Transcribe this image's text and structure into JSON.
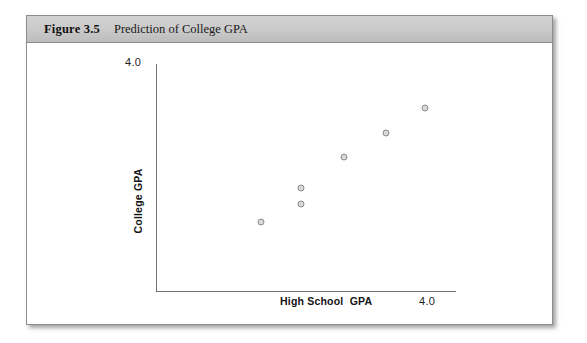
{
  "figure": {
    "caption_label": "Figure 3.5",
    "caption_text": "Prediction of College GPA"
  },
  "chart_data": {
    "type": "scatter",
    "title": "Prediction of College GPA",
    "xlabel": "High School  GPA",
    "ylabel": "College GPA",
    "xlim": [
      0,
      4.0
    ],
    "ylim": [
      0,
      4.0
    ],
    "x_tick_labels": [
      "4.0"
    ],
    "y_tick_labels": [
      "4.0"
    ],
    "grid": false,
    "legend": null,
    "marker": {
      "shape": "circle-open",
      "fill_color": "#d8d8d8",
      "edge_color": "#8b8b8b"
    },
    "axis_color": "#737373",
    "points": [
      {
        "x": 1.4,
        "y": 1.22
      },
      {
        "x": 1.93,
        "y": 1.53
      },
      {
        "x": 1.93,
        "y": 1.81
      },
      {
        "x": 2.51,
        "y": 2.36
      },
      {
        "x": 3.06,
        "y": 2.79
      },
      {
        "x": 3.59,
        "y": 3.22
      }
    ]
  },
  "axes": {
    "y_max_label": "4.0",
    "x_max_label": "4.0",
    "y_title": "College GPA",
    "x_title": "High School  GPA"
  }
}
